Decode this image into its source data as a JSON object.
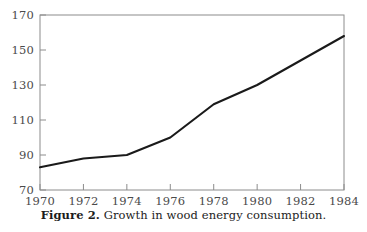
{
  "caption": {
    "label": "Figure 2.",
    "text": "Growth in wood energy consumption."
  },
  "colors": {
    "line": "#1a1a1a",
    "frame": "#8c8c8c",
    "tick_text": "#4a4a4a",
    "background": "#ffffff"
  },
  "chart_data": {
    "type": "line",
    "title": "",
    "subtitle": "",
    "xlabel": "",
    "ylabel": "",
    "x": [
      1970,
      1972,
      1974,
      1976,
      1978,
      1980,
      1982,
      1984
    ],
    "values": [
      83,
      88,
      90,
      100,
      119,
      130,
      144,
      158
    ],
    "series": [
      {
        "name": "Wood energy consumption",
        "values": [
          83,
          88,
          90,
          100,
          119,
          130,
          144,
          158
        ]
      }
    ],
    "xlim": [
      1970,
      1984
    ],
    "ylim": [
      70,
      170
    ],
    "xticks": [
      1970,
      1972,
      1974,
      1976,
      1978,
      1980,
      1982,
      1984
    ],
    "yticks": [
      70,
      90,
      110,
      130,
      150,
      170
    ],
    "xtick_labels": [
      "1970",
      "1972",
      "1974",
      "1976",
      "1978",
      "1980",
      "1982",
      "1984"
    ],
    "ytick_labels": [
      "70",
      "90",
      "110",
      "130",
      "150",
      "170"
    ],
    "grid": false,
    "legend": false,
    "legend_position": "none"
  }
}
